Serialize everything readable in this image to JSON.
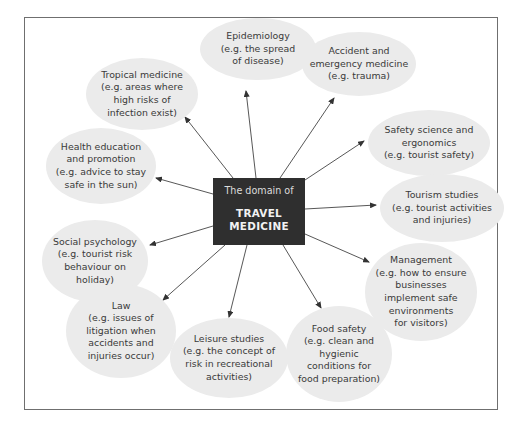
{
  "diagram": {
    "center": {
      "subtitle": "The domain of",
      "title_line1": "TRAVEL",
      "title_line2": "MEDICINE",
      "fill": "#2f2f2f",
      "text_color": "#f2f2f2"
    },
    "bubble_fill": "#ebebeb",
    "nodes": [
      {
        "id": "epidemiology",
        "lines": [
          "Epidemiology",
          "(e.g. the spread",
          "of disease)"
        ]
      },
      {
        "id": "accident",
        "lines": [
          "Accident and",
          "emergency medicine",
          "(e.g. trauma)"
        ]
      },
      {
        "id": "tropical",
        "lines": [
          "Tropical medicine",
          "(e.g. areas where",
          "high risks of",
          "infection exist)"
        ]
      },
      {
        "id": "safety",
        "lines": [
          "Safety science and",
          "ergonomics",
          "(e.g. tourist safety)"
        ]
      },
      {
        "id": "health",
        "lines": [
          "Health education",
          "and promotion",
          "(e.g. advice to stay",
          "safe in the sun)"
        ]
      },
      {
        "id": "tourism",
        "lines": [
          "Tourism studies",
          "(e.g. tourist activities",
          "and injuries)"
        ]
      },
      {
        "id": "social",
        "lines": [
          "Social psychology",
          "(e.g. tourist risk",
          "behaviour on",
          "holiday)"
        ]
      },
      {
        "id": "management",
        "lines": [
          "Management",
          "(e.g. how to ensure",
          "businesses",
          "implement safe",
          "environments",
          "for visitors)"
        ]
      },
      {
        "id": "law",
        "lines": [
          "Law",
          "(e.g. issues of",
          "litigation when",
          "accidents and",
          "injuries occur)"
        ]
      },
      {
        "id": "leisure",
        "lines": [
          "Leisure studies",
          "(e.g. the concept of",
          "risk in recreational",
          "activities)"
        ]
      },
      {
        "id": "food",
        "lines": [
          "Food safety",
          "(e.g. clean and",
          "hygienic",
          "conditions for",
          "food preparation)"
        ]
      }
    ]
  }
}
